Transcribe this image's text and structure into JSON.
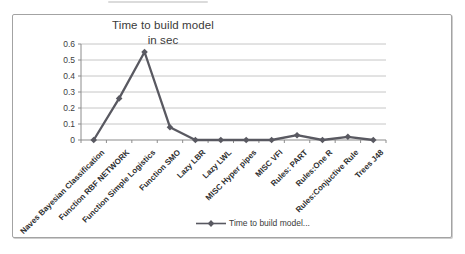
{
  "chart_data": {
    "type": "line",
    "title": "Time to build model in sec",
    "title_lines": [
      "Time to build model",
      "in sec"
    ],
    "categories": [
      "Naves Bayesian Classification",
      "Function RBF NETWORK",
      "Function Simple Logistics",
      "Function SMO",
      "Lazy LBR",
      "Lazy LWL",
      "MISC Hyper pipes",
      "MISC VFI",
      "Rules: PART",
      "Rules:One R",
      "Rules:Conjuctive Rule",
      "Trees J48"
    ],
    "series": [
      {
        "name": "Time to build model...",
        "values": [
          0,
          0.26,
          0.55,
          0.08,
          0,
          0,
          0,
          0,
          0.03,
          0,
          0.02,
          0
        ]
      }
    ],
    "xlabel": "",
    "ylabel": "",
    "ylim": [
      0,
      0.6
    ],
    "ytick_labels": [
      "0.6",
      "0.5",
      "0.4",
      "0.3",
      "0.2",
      "0.1",
      "0"
    ],
    "grid": true,
    "legend_position": "bottom",
    "marker": "diamond",
    "colors": {
      "line": "#595961",
      "gridline": "#c6c6c6",
      "axis": "#8c8c8c",
      "frame_border": "#a3a3a3",
      "title_text": "#3a3a3a",
      "label_text": "#2d2d2d"
    }
  }
}
